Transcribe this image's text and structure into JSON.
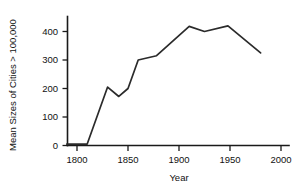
{
  "chart_data": {
    "type": "line",
    "title": "",
    "xlabel": "Year",
    "ylabel": "Mean Sizes of Cities > 100,000",
    "xlim": [
      1788,
      2010
    ],
    "ylim": [
      -15,
      440
    ],
    "xticks": [
      1800,
      1850,
      1900,
      1950,
      2000
    ],
    "xtick_labels": [
      "1800",
      "1850",
      "1900",
      "1950",
      "2000"
    ],
    "yticks": [
      0,
      100,
      200,
      300,
      400
    ],
    "ytick_labels": [
      "0",
      "100",
      "200",
      "300",
      "400"
    ],
    "grid": false,
    "legend": false,
    "series": [
      {
        "name": "Mean Sizes of Cities > 100,000",
        "color": "#2b2b2b",
        "x": [
          1790,
          1800,
          1810,
          1830,
          1841,
          1850,
          1860,
          1878,
          1910,
          1925,
          1948,
          1980
        ],
        "values": [
          5,
          5,
          5,
          205,
          172,
          200,
          300,
          315,
          418,
          400,
          420,
          325
        ]
      }
    ]
  },
  "axes": {
    "y_title": "Mean Sizes of Cities > 100,000",
    "x_title": "Year"
  }
}
